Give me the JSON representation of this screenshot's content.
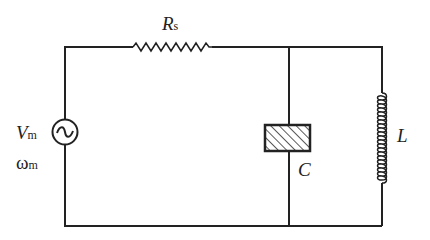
{
  "diagram": {
    "type": "RLC circuit schematic",
    "components": {
      "source": {
        "symbol": "V",
        "subscript": "m",
        "freq_symbol": "ω",
        "freq_subscript": "m",
        "icon": "ac-source-icon"
      },
      "resistor": {
        "symbol": "R",
        "subscript": "s"
      },
      "capacitor": {
        "symbol": "C"
      },
      "inductor": {
        "symbol": "L"
      }
    },
    "colors": {
      "wire": "#222222",
      "background": "#ffffff"
    }
  }
}
